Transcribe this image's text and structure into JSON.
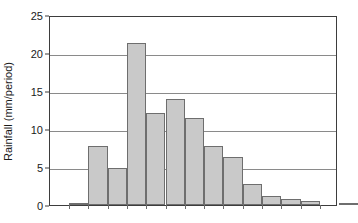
{
  "chart_data": {
    "type": "bar",
    "title": "",
    "subtitle": "",
    "xlabel": "",
    "ylabel": "Rainfall (mm/period)",
    "ylim": [
      0,
      25
    ],
    "yticks": [
      0,
      5,
      10,
      15,
      20,
      25
    ],
    "ytick_labels": [
      "0",
      "5",
      "10",
      "15",
      "20",
      "25"
    ],
    "xtick_labels": [],
    "grid": "horizontal",
    "legend": "none",
    "bar_color": "#c9c9c9",
    "bar_edge_color": "#6e6e6e",
    "axis_color": "#3d3d3d",
    "gridline_color": "#8a8a8a",
    "background_color": "#ffffff",
    "categories": [
      "1",
      "2",
      "3",
      "4",
      "5",
      "6",
      "7",
      "8",
      "9",
      "10",
      "11",
      "12",
      "13",
      "14",
      "15"
    ],
    "values": [
      0.2,
      7.7,
      4.9,
      21.3,
      12.1,
      13.9,
      11.5,
      7.7,
      6.3,
      2.8,
      1.2,
      0.85,
      0.55,
      0.0,
      0.15
    ],
    "n_bars": 15,
    "max_value": 21.3,
    "annotations": []
  },
  "axes": {
    "y_axis_title": "Rainfall (mm/period)"
  }
}
